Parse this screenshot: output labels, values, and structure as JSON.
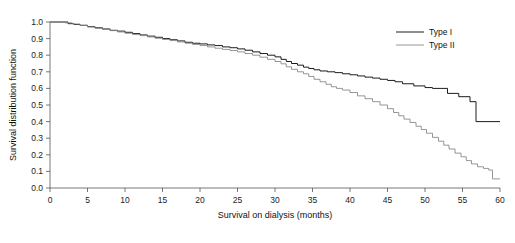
{
  "chart_data": {
    "type": "line",
    "title": "",
    "xlabel": "Survival on dialysis (months)",
    "ylabel": "Survival distribution function",
    "xlim": [
      0,
      60
    ],
    "ylim": [
      0.0,
      1.0
    ],
    "xticks": [
      0,
      5,
      10,
      15,
      20,
      25,
      30,
      35,
      40,
      45,
      50,
      55,
      60
    ],
    "xtick_labels": [
      "0",
      "5",
      "10",
      "15",
      "20",
      "25",
      "30",
      "35",
      "40",
      "45",
      "50",
      "55",
      "60"
    ],
    "yticks": [
      0.0,
      0.1,
      0.2,
      0.3,
      0.4,
      0.5,
      0.6,
      0.7,
      0.8,
      0.9,
      1.0
    ],
    "ytick_labels": [
      "0.0",
      "0.1",
      "0.2",
      "0.3",
      "0.4",
      "0.5",
      "0.6",
      "0.7",
      "0.8",
      "0.9",
      "1.0"
    ],
    "grid": false,
    "step_style": "post",
    "legend_position": "top-right",
    "legend_entries": [
      "Type I",
      "Type II"
    ],
    "series": [
      {
        "name": "Type I",
        "color": "#1c1c1c",
        "width": 1.0,
        "points": [
          [
            0.0,
            1.0
          ],
          [
            1.5,
            1.0
          ],
          [
            2.4,
            0.99
          ],
          [
            3.2,
            0.985
          ],
          [
            4.0,
            0.98
          ],
          [
            5.0,
            0.972
          ],
          [
            6.0,
            0.965
          ],
          [
            7.0,
            0.958
          ],
          [
            8.0,
            0.95
          ],
          [
            9.0,
            0.945
          ],
          [
            10.0,
            0.938
          ],
          [
            11.0,
            0.93
          ],
          [
            12.0,
            0.922
          ],
          [
            13.0,
            0.915
          ],
          [
            14.0,
            0.908
          ],
          [
            15.0,
            0.9
          ],
          [
            16.0,
            0.893
          ],
          [
            17.0,
            0.886
          ],
          [
            18.0,
            0.878
          ],
          [
            19.0,
            0.872
          ],
          [
            20.0,
            0.868
          ],
          [
            21.0,
            0.862
          ],
          [
            22.0,
            0.858
          ],
          [
            23.0,
            0.85
          ],
          [
            24.0,
            0.845
          ],
          [
            25.0,
            0.838
          ],
          [
            26.0,
            0.83
          ],
          [
            27.0,
            0.82
          ],
          [
            28.0,
            0.81
          ],
          [
            29.0,
            0.8
          ],
          [
            30.0,
            0.79
          ],
          [
            30.8,
            0.775
          ],
          [
            31.5,
            0.762
          ],
          [
            32.2,
            0.75
          ],
          [
            33.0,
            0.74
          ],
          [
            33.8,
            0.728
          ],
          [
            34.5,
            0.72
          ],
          [
            35.2,
            0.712
          ],
          [
            36.0,
            0.705
          ],
          [
            37.0,
            0.7
          ],
          [
            38.0,
            0.695
          ],
          [
            39.0,
            0.688
          ],
          [
            40.0,
            0.682
          ],
          [
            41.0,
            0.675
          ],
          [
            42.0,
            0.668
          ],
          [
            43.0,
            0.662
          ],
          [
            44.0,
            0.655
          ],
          [
            45.0,
            0.648
          ],
          [
            46.0,
            0.64
          ],
          [
            47.0,
            0.628
          ],
          [
            48.5,
            0.615
          ],
          [
            50.0,
            0.605
          ],
          [
            51.0,
            0.6
          ],
          [
            52.0,
            0.6
          ],
          [
            53.0,
            0.57
          ],
          [
            54.5,
            0.55
          ],
          [
            56.0,
            0.52
          ],
          [
            56.8,
            0.4
          ],
          [
            60.0,
            0.4
          ]
        ]
      },
      {
        "name": "Type II",
        "color": "#8a8a8a",
        "width": 0.9,
        "points": [
          [
            0.0,
            1.0
          ],
          [
            1.2,
            1.0
          ],
          [
            2.0,
            0.995
          ],
          [
            3.0,
            0.988
          ],
          [
            4.0,
            0.98
          ],
          [
            5.0,
            0.97
          ],
          [
            6.0,
            0.962
          ],
          [
            7.0,
            0.955
          ],
          [
            8.0,
            0.948
          ],
          [
            9.0,
            0.94
          ],
          [
            10.0,
            0.932
          ],
          [
            11.0,
            0.925
          ],
          [
            12.0,
            0.918
          ],
          [
            13.0,
            0.91
          ],
          [
            14.0,
            0.902
          ],
          [
            15.0,
            0.895
          ],
          [
            16.0,
            0.888
          ],
          [
            17.0,
            0.88
          ],
          [
            18.0,
            0.872
          ],
          [
            19.0,
            0.865
          ],
          [
            20.0,
            0.858
          ],
          [
            21.0,
            0.85
          ],
          [
            22.0,
            0.842
          ],
          [
            23.0,
            0.835
          ],
          [
            24.0,
            0.828
          ],
          [
            25.0,
            0.82
          ],
          [
            26.0,
            0.81
          ],
          [
            27.0,
            0.8
          ],
          [
            28.0,
            0.788
          ],
          [
            29.0,
            0.775
          ],
          [
            30.0,
            0.762
          ],
          [
            30.8,
            0.748
          ],
          [
            31.5,
            0.73
          ],
          [
            32.2,
            0.715
          ],
          [
            33.0,
            0.7
          ],
          [
            33.8,
            0.688
          ],
          [
            34.5,
            0.672
          ],
          [
            35.2,
            0.655
          ],
          [
            36.0,
            0.64
          ],
          [
            36.8,
            0.625
          ],
          [
            37.5,
            0.61
          ],
          [
            38.2,
            0.6
          ],
          [
            39.0,
            0.59
          ],
          [
            40.0,
            0.575
          ],
          [
            41.0,
            0.555
          ],
          [
            42.0,
            0.538
          ],
          [
            43.0,
            0.52
          ],
          [
            44.0,
            0.5
          ],
          [
            45.0,
            0.478
          ],
          [
            45.8,
            0.455
          ],
          [
            46.5,
            0.435
          ],
          [
            47.2,
            0.415
          ],
          [
            48.0,
            0.395
          ],
          [
            48.8,
            0.372
          ],
          [
            49.5,
            0.352
          ],
          [
            50.2,
            0.33
          ],
          [
            51.0,
            0.305
          ],
          [
            51.8,
            0.282
          ],
          [
            52.5,
            0.258
          ],
          [
            53.2,
            0.235
          ],
          [
            54.0,
            0.21
          ],
          [
            54.8,
            0.188
          ],
          [
            55.5,
            0.165
          ],
          [
            56.2,
            0.145
          ],
          [
            57.0,
            0.128
          ],
          [
            57.8,
            0.118
          ],
          [
            58.5,
            0.108
          ],
          [
            59.0,
            0.055
          ],
          [
            60.0,
            0.055
          ]
        ]
      }
    ]
  },
  "axes": {
    "ylabel": "Survival distribution function",
    "xlabel": "Survival on dialysis (months)"
  },
  "legend": {
    "items": [
      {
        "label": "Type I"
      },
      {
        "label": "Type II"
      }
    ]
  }
}
